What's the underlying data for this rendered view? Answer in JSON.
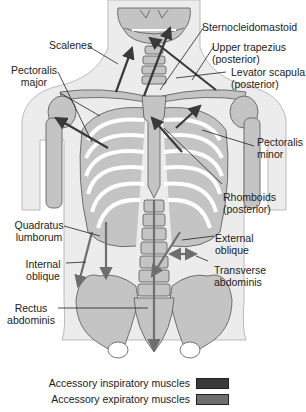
{
  "figure": {
    "type": "anatomical-diagram",
    "colors": {
      "bone": "#c4c4c4",
      "bone_outline": "#555555",
      "body_silhouette": "#ececec",
      "inspiratory_arrow": "#3a3a3a",
      "expiratory_arrow": "#6e6e6e",
      "leader_line": "#222222"
    }
  },
  "labels": {
    "scalenes": "Scalenes",
    "sternocleidomastoid": "Sternocleidomastoid",
    "upper_trapezius": [
      "Upper trapezius",
      "(posterior)"
    ],
    "pectoralis_major": [
      "Pectoralis",
      "major"
    ],
    "levator_scapula": [
      "Levator scapula",
      "(posterior)"
    ],
    "pectoralis_minor": [
      "Pectoralis",
      "minor"
    ],
    "rhomboids": [
      "Rhomboids",
      "(posterior)"
    ],
    "quadratus_lumborum": [
      "Quadratus",
      "lumborum"
    ],
    "external_oblique": [
      "External",
      "oblique"
    ],
    "internal_oblique": [
      "Internal",
      "oblique"
    ],
    "transverse_abdominis": [
      "Transverse",
      "abdominis"
    ],
    "rectus_abdominis": [
      "Rectus",
      "abdominis"
    ]
  },
  "legend": {
    "items": [
      {
        "label": "Accessory inspiratory muscles",
        "color": "#3a3a3a"
      },
      {
        "label": "Accessory expiratory muscles",
        "color": "#6e6e6e"
      }
    ]
  }
}
